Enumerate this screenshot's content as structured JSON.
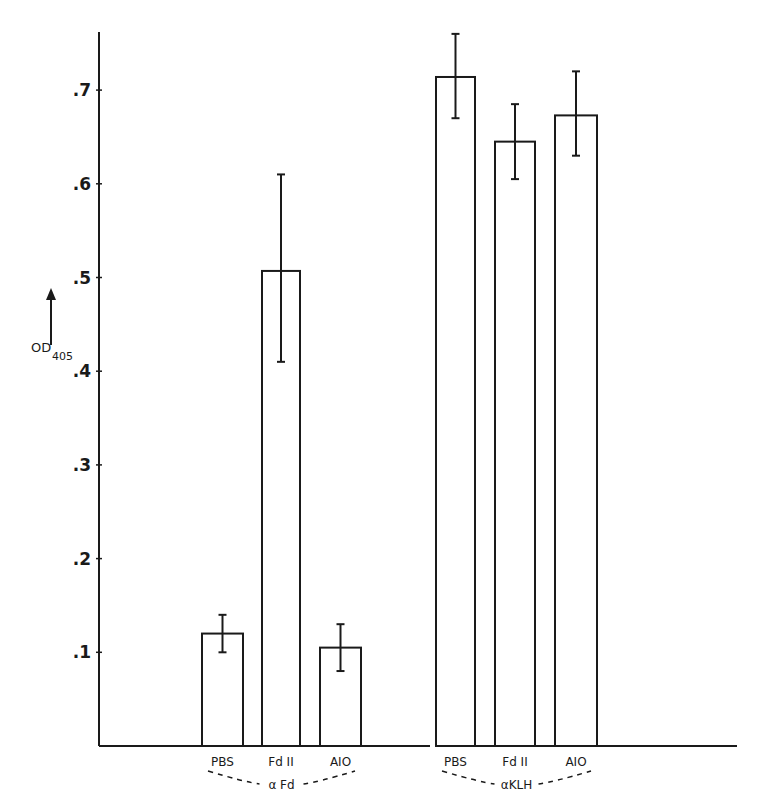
{
  "chart_data": {
    "type": "bar",
    "title": "",
    "xlabel": "",
    "ylabel": "OD",
    "ylabel_subscript": "405",
    "ylim": [
      0,
      0.76
    ],
    "yticks": [
      0.1,
      0.2,
      0.3,
      0.4,
      0.5,
      0.6,
      0.7
    ],
    "ytick_labels": [
      ".1",
      ".2",
      ".3",
      ".4",
      ".5",
      ".6",
      ".7"
    ],
    "grid": false,
    "legend": null,
    "groups": [
      {
        "name": "α Fd",
        "categories": [
          "PBS",
          "Fd II",
          "AIO"
        ],
        "values": [
          0.12,
          0.507,
          0.105
        ],
        "error_low": [
          0.1,
          0.41,
          0.08
        ],
        "error_high": [
          0.14,
          0.61,
          0.13
        ]
      },
      {
        "name": "αKLH",
        "categories": [
          "PBS",
          "Fd II",
          "AIO"
        ],
        "values": [
          0.714,
          0.645,
          0.673
        ],
        "error_low": [
          0.67,
          0.605,
          0.63
        ],
        "error_high": [
          0.76,
          0.685,
          0.72
        ]
      }
    ]
  },
  "colors": {
    "ink": "#1a1a1a",
    "background": "#ffffff"
  }
}
